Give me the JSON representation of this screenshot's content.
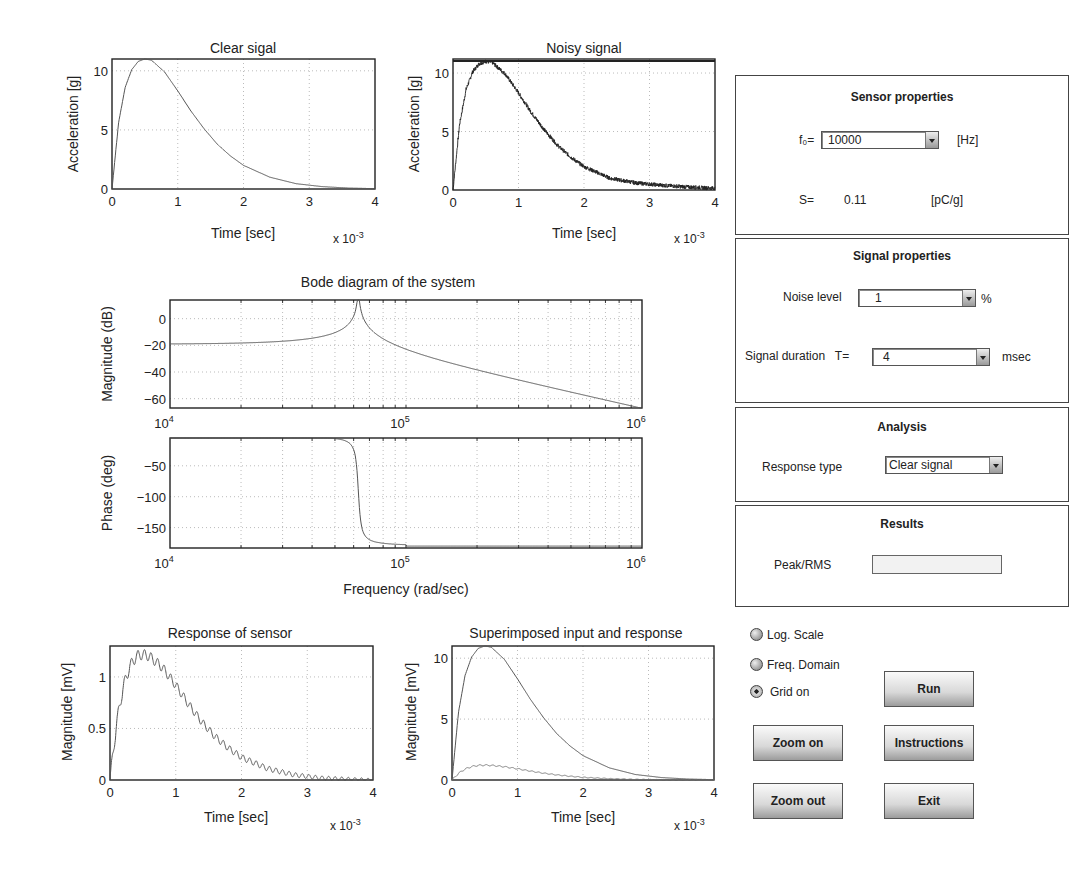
{
  "plots": {
    "clear": {
      "title": "Clear sigal",
      "xlabel": "Time [sec]",
      "ylabel": "Acceleration [g]",
      "xexp": "x 10",
      "xexp_pow": "-3"
    },
    "noisy": {
      "title": "Noisy signal",
      "xlabel": "Time [sec]",
      "ylabel": "Acceleration [g]",
      "xexp": "x 10",
      "xexp_pow": "-3"
    },
    "bode": {
      "title": "Bode diagram of the system",
      "mag_ylabel": "Magnitude (dB)",
      "phase_ylabel": "Phase (deg)",
      "xlabel": "Frequency (rad/sec)"
    },
    "sensor": {
      "title": "Response of sensor",
      "xlabel": "Time [sec]",
      "ylabel": "Magnitude [mV]",
      "xexp": "x 10",
      "xexp_pow": "-3"
    },
    "superimposed": {
      "title": "Superimposed input and response",
      "xlabel": "Time [sec]",
      "ylabel": "Magnitude [mV]",
      "xexp": "x 10",
      "xexp_pow": "-3"
    }
  },
  "sensor_panel": {
    "title": "Sensor properties",
    "f0_label": "f₀=",
    "f0_value": "10000",
    "f0_unit": "[Hz]",
    "s_label": "S=",
    "s_value": "0.11",
    "s_unit": "[pC/g]"
  },
  "signal_panel": {
    "title": "Signal properties",
    "noise_label": "Noise level",
    "noise_value": "1",
    "noise_unit": "%",
    "duration_label": "Signal duration   T=",
    "duration_value": "4",
    "duration_unit": "msec"
  },
  "analysis_panel": {
    "title": "Analysis",
    "response_label": "Response type",
    "response_value": "Clear signal"
  },
  "results_panel": {
    "title": "Results",
    "peak_label": "Peak/RMS",
    "peak_value": ""
  },
  "options": [
    {
      "label": "Log. Scale",
      "checked": false
    },
    {
      "label": "Freq. Domain",
      "checked": false
    },
    {
      "label": "Grid on",
      "checked": true
    }
  ],
  "buttons": {
    "run": "Run",
    "zoom_on": "Zoom on",
    "instructions": "Instructions",
    "zoom_out": "Zoom out",
    "exit": "Exit"
  },
  "chart_data": [
    {
      "id": "clear",
      "type": "line",
      "title": "Clear sigal",
      "xlabel": "Time [sec]",
      "ylabel": "Acceleration [g]",
      "x_scale_note": "x 10^-3",
      "xlim": [
        0,
        4
      ],
      "ylim": [
        0,
        11
      ],
      "xticks": [
        0,
        1,
        2,
        3,
        4
      ],
      "yticks": [
        0,
        5,
        10
      ],
      "grid": true,
      "series": [
        {
          "name": "clear signal",
          "x": [
            0,
            0.1,
            0.2,
            0.3,
            0.4,
            0.5,
            0.6,
            0.8,
            1.0,
            1.2,
            1.4,
            1.6,
            1.8,
            2.0,
            2.4,
            2.8,
            3.2,
            3.6,
            4.0
          ],
          "y": [
            0,
            5.6,
            8.6,
            10.1,
            10.8,
            11.0,
            10.9,
            9.9,
            8.3,
            6.6,
            5.1,
            3.8,
            2.8,
            2.0,
            1.0,
            0.45,
            0.2,
            0.08,
            0.03
          ]
        }
      ]
    },
    {
      "id": "noisy",
      "type": "line",
      "title": "Noisy signal",
      "xlabel": "Time [sec]",
      "ylabel": "Acceleration [g]",
      "x_scale_note": "x 10^-3",
      "xlim": [
        0,
        4
      ],
      "ylim": [
        0,
        11.2
      ],
      "xticks": [
        0,
        1,
        2,
        3,
        4
      ],
      "yticks": [
        0,
        5,
        10
      ],
      "grid": true,
      "noise_percent": 1,
      "series": [
        {
          "name": "noisy signal",
          "x": [
            0,
            0.1,
            0.2,
            0.3,
            0.4,
            0.5,
            0.6,
            0.8,
            1.0,
            1.2,
            1.4,
            1.6,
            1.8,
            2.0,
            2.4,
            2.8,
            3.2,
            3.6,
            4.0
          ],
          "y": [
            0,
            5.6,
            8.6,
            10.1,
            10.8,
            11.0,
            10.9,
            9.9,
            8.3,
            6.6,
            5.1,
            3.8,
            2.8,
            2.0,
            1.0,
            0.6,
            0.4,
            0.25,
            0.15
          ]
        }
      ]
    },
    {
      "id": "bode_mag",
      "type": "line",
      "title": "Bode diagram of the system",
      "xlabel": "",
      "ylabel": "Magnitude (dB)",
      "xscale": "log",
      "xlim": [
        10000,
        1000000
      ],
      "ylim": [
        -67,
        14
      ],
      "xticks": [
        "10^4",
        "10^5",
        "10^6"
      ],
      "yticks": [
        0,
        -20,
        -40,
        -60
      ],
      "grid": true,
      "series": [
        {
          "name": "magnitude",
          "x": [
            10000,
            20000,
            30000,
            40000,
            50000,
            56000,
            60000,
            62800,
            65000,
            70000,
            80000,
            100000,
            200000,
            500000,
            1000000
          ],
          "y": [
            -19,
            -18.5,
            -17.5,
            -16,
            -12.5,
            -7,
            0,
            14,
            2,
            -8,
            -15,
            -21,
            -37,
            -53,
            -67
          ]
        }
      ]
    },
    {
      "id": "bode_phase",
      "type": "line",
      "xlabel": "Frequency (rad/sec)",
      "ylabel": "Phase (deg)",
      "xscale": "log",
      "xlim": [
        10000,
        1000000
      ],
      "ylim": [
        -183,
        -5
      ],
      "xticks": [
        "10^4",
        "10^5",
        "10^6"
      ],
      "yticks": [
        -50,
        -100,
        -150
      ],
      "grid": true,
      "series": [
        {
          "name": "phase",
          "x": [
            10000,
            40000,
            55000,
            59000,
            61000,
            62000,
            62800,
            63600,
            65000,
            67000,
            72000,
            85000,
            100000,
            1000000
          ],
          "y": [
            -5,
            -5,
            -6,
            -10,
            -30,
            -60,
            -90,
            -120,
            -150,
            -170,
            -177,
            -180,
            -180,
            -180
          ]
        }
      ]
    },
    {
      "id": "sensor_response",
      "type": "line",
      "title": "Response of sensor",
      "xlabel": "Time [sec]",
      "ylabel": "Magnitude [mV]",
      "x_scale_note": "x 10^-3",
      "xlim": [
        0,
        4
      ],
      "ylim": [
        0,
        1.3
      ],
      "xticks": [
        0,
        1,
        2,
        3,
        4
      ],
      "yticks": [
        0,
        0.5,
        1
      ],
      "grid": true,
      "oscillation_period_ms": 0.1,
      "series": [
        {
          "name": "sensor response",
          "x": [
            0,
            0.1,
            0.2,
            0.3,
            0.4,
            0.5,
            0.6,
            0.8,
            1.0,
            1.2,
            1.4,
            1.6,
            1.8,
            2.0,
            2.4,
            2.8,
            3.2,
            3.6,
            4.0
          ],
          "y": [
            0,
            0.55,
            0.9,
            1.1,
            1.2,
            1.22,
            1.2,
            1.09,
            0.92,
            0.73,
            0.56,
            0.42,
            0.31,
            0.22,
            0.11,
            0.05,
            0.02,
            0.01,
            0.0
          ]
        }
      ]
    },
    {
      "id": "superimposed",
      "type": "line",
      "title": "Superimposed input and response",
      "xlabel": "Time [sec]",
      "ylabel": "Magnitude [mV]",
      "x_scale_note": "x 10^-3",
      "xlim": [
        0,
        4
      ],
      "ylim": [
        0,
        11
      ],
      "xticks": [
        0,
        1,
        2,
        3,
        4
      ],
      "yticks": [
        0,
        5,
        10
      ],
      "grid": true,
      "series": [
        {
          "name": "input",
          "x": [
            0,
            0.1,
            0.2,
            0.3,
            0.4,
            0.5,
            0.6,
            0.8,
            1.0,
            1.2,
            1.4,
            1.6,
            1.8,
            2.0,
            2.4,
            2.8,
            3.2,
            3.6,
            4.0
          ],
          "y": [
            0,
            5.6,
            8.6,
            10.1,
            10.8,
            11.0,
            10.9,
            9.9,
            8.3,
            6.6,
            5.1,
            3.8,
            2.8,
            2.0,
            1.0,
            0.45,
            0.2,
            0.08,
            0.03
          ]
        },
        {
          "name": "response",
          "x": [
            0,
            0.1,
            0.2,
            0.3,
            0.4,
            0.5,
            0.6,
            0.8,
            1.0,
            1.2,
            1.4,
            1.6,
            1.8,
            2.0,
            2.4,
            2.8,
            3.2,
            3.6,
            4.0
          ],
          "y": [
            0,
            0.55,
            0.9,
            1.1,
            1.2,
            1.22,
            1.2,
            1.09,
            0.92,
            0.73,
            0.56,
            0.42,
            0.31,
            0.22,
            0.11,
            0.05,
            0.02,
            0.01,
            0.0
          ]
        }
      ]
    }
  ]
}
